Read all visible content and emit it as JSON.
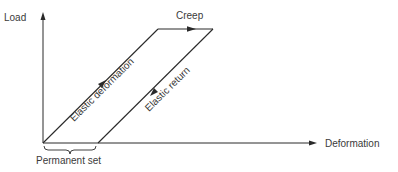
{
  "diagram": {
    "type": "load-deformation",
    "axes": {
      "y_label": "Load",
      "x_label": "Deformation"
    },
    "segments": [
      {
        "id": "elastic-deformation",
        "label": "Elastic deformation",
        "direction": "up-right"
      },
      {
        "id": "creep",
        "label": "Creep",
        "direction": "right"
      },
      {
        "id": "elastic-return",
        "label": "Elastic return",
        "direction": "down-left"
      }
    ],
    "annotations": {
      "permanent_set": "Permanent set"
    },
    "colors": {
      "line": "#2a2a2a",
      "text": "#3a3a3a",
      "background": "#ffffff"
    }
  }
}
